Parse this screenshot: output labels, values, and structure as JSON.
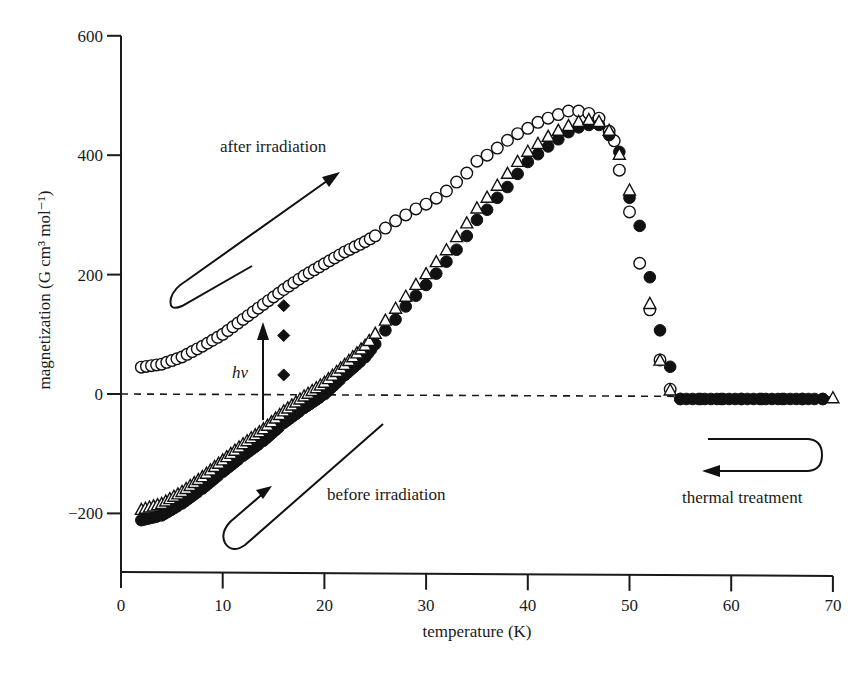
{
  "chart_data": {
    "type": "scatter",
    "title": "",
    "xlabel": "temperature (K)",
    "ylabel": "magnetization (G cm³ mol⁻¹)",
    "xlim": [
      0,
      70
    ],
    "ylim": [
      -300,
      600
    ],
    "x_ticks": [
      0,
      10,
      20,
      30,
      40,
      50,
      60,
      70
    ],
    "y_ticks": [
      -200,
      0,
      200,
      400,
      600
    ],
    "x_tick_labels": [
      "0",
      "10",
      "20",
      "30",
      "40",
      "50",
      "60",
      "70"
    ],
    "y_tick_labels": [
      "−200",
      "0",
      "200",
      "400",
      "600"
    ],
    "grid": false,
    "reference_line": {
      "y": 0,
      "style": "dashed"
    },
    "series": [
      {
        "name": "after irradiation (open circles)",
        "marker": "open-circle",
        "x": [
          2,
          4,
          6,
          8,
          10,
          12,
          14,
          16,
          18,
          20,
          22,
          24,
          25,
          26,
          27,
          28,
          29,
          30,
          31,
          32,
          33,
          34,
          35,
          36,
          37,
          38,
          39,
          40,
          41,
          42,
          43,
          44,
          45,
          46,
          47,
          48,
          48.5,
          49,
          50,
          51,
          52,
          53,
          54
        ],
        "y": [
          45,
          50,
          62,
          80,
          100,
          125,
          150,
          175,
          198,
          218,
          238,
          255,
          265,
          278,
          290,
          300,
          310,
          318,
          328,
          340,
          355,
          370,
          390,
          400,
          412,
          425,
          436,
          445,
          455,
          462,
          468,
          474,
          474,
          470,
          462,
          440,
          424,
          375,
          305,
          219,
          141,
          57,
          8
        ]
      },
      {
        "name": "before irradiation (filled circles)",
        "marker": "filled-circle",
        "x": [
          2,
          4,
          6,
          8,
          10,
          12,
          14,
          16,
          18,
          20,
          22,
          24,
          25,
          26,
          27,
          28,
          29,
          30,
          31,
          32,
          33,
          34,
          35,
          36,
          37,
          38,
          39,
          40,
          41,
          42,
          43,
          44,
          45,
          46,
          47,
          48,
          49,
          50,
          51,
          52,
          53,
          54,
          55,
          57,
          59,
          61,
          63,
          65,
          67,
          69
        ],
        "y": [
          -208,
          -200,
          -180,
          -155,
          -127,
          -100,
          -75,
          -45,
          -20,
          3,
          35,
          65,
          87,
          110,
          128,
          150,
          168,
          186,
          205,
          225,
          245,
          268,
          295,
          312,
          332,
          350,
          372,
          392,
          405,
          418,
          430,
          442,
          450,
          454,
          454,
          437,
          409,
          332,
          285,
          199,
          110,
          49,
          -5,
          -5,
          -5,
          -5,
          -5,
          -5,
          -5,
          -5
        ]
      },
      {
        "name": "before irradiation (open triangles)",
        "marker": "open-triangle",
        "x": [
          2,
          4,
          6,
          8,
          10,
          12,
          14,
          16,
          18,
          20,
          22,
          24,
          25,
          26,
          27,
          28,
          29,
          30,
          31,
          32,
          33,
          34,
          35,
          36,
          37,
          38,
          39,
          40,
          41,
          42,
          43,
          44,
          45,
          46,
          47,
          48,
          49,
          50,
          52,
          53,
          54,
          70
        ],
        "y": [
          -195,
          -185,
          -165,
          -140,
          -112,
          -85,
          -60,
          -30,
          -5,
          18,
          48,
          80,
          100,
          122,
          142,
          162,
          182,
          200,
          220,
          240,
          262,
          285,
          310,
          328,
          348,
          368,
          388,
          405,
          418,
          430,
          440,
          448,
          455,
          458,
          455,
          440,
          400,
          340,
          150,
          55,
          5,
          -8
        ]
      },
      {
        "name": "irradiation at 16 K (filled diamonds)",
        "marker": "filled-diamond",
        "x": [
          16,
          16,
          16
        ],
        "y": [
          148,
          98,
          32
        ]
      }
    ],
    "annotations": [
      {
        "text": "after irradiation",
        "x": 24,
        "y": 420
      },
      {
        "text": "before irradiation",
        "x": 29,
        "y": -168
      },
      {
        "text": "thermal treatment",
        "x": 64,
        "y": -170
      },
      {
        "text": "hν",
        "x": 14,
        "y": 40,
        "style": "italic"
      }
    ]
  }
}
